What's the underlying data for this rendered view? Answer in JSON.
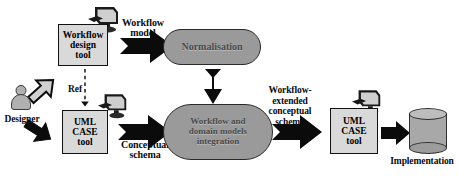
{
  "diagram": {
    "nodes": {
      "designer": {
        "label": "Designer",
        "icon": "user-actor-icon"
      },
      "workflow_design_tool": {
        "label": "Workflow\ndesign\ntool",
        "icon": "computer-icon"
      },
      "uml_case_tool_left": {
        "label": "UML\nCASE\ntool",
        "icon": "computer-icon"
      },
      "normalisation": {
        "label": "Normalisation"
      },
      "integration": {
        "label": "Workflow and\ndomain models\nintegration"
      },
      "uml_case_tool_right": {
        "label": "UML\nCASE\ntool",
        "icon": "computer-icon"
      },
      "implementation": {
        "label": "Implementation",
        "icon": "database-cylinder-icon"
      }
    },
    "edges": {
      "workflow_model": {
        "label": "Workflow\nmodel"
      },
      "conceptual_schema": {
        "label": "Conceptual\nschema"
      },
      "workflow_extended_conceptual_schema": {
        "label": "Workflow-\nextended\nconceptual\nschema"
      },
      "ref": {
        "label": "Ref",
        "style": "dashed"
      },
      "designer_to_workflow_tool": {
        "label": "",
        "style": "hollow-block-arrow"
      },
      "designer_to_uml_tool": {
        "label": "",
        "style": "solid-block-arrow"
      },
      "normalisation_to_integration": {
        "label": "",
        "style": "vertical-down-arrow"
      },
      "uml_to_implementation": {
        "label": "",
        "style": "solid-block-arrow"
      }
    },
    "colors": {
      "outline": "#111111",
      "box_fill": "#d9d9d9",
      "process_fill": "#9a9a9a",
      "process_text": "#4a4a4a",
      "cylinder_fill": "#a8a8a8",
      "actor_fill": "#b0b0b0",
      "arrow_fill": "#000000",
      "background": "#ffffff"
    }
  }
}
